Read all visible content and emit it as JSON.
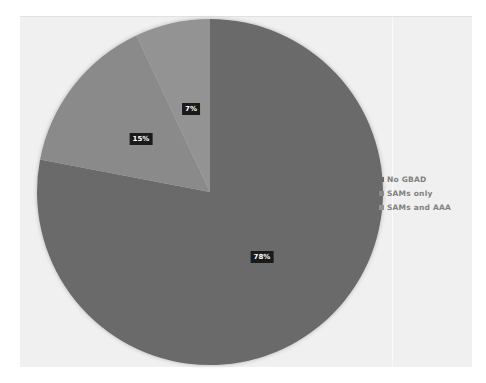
{
  "chart_data": {
    "type": "pie",
    "title": "",
    "categories": [
      "No GBAD",
      "SAMs only",
      "SAMs and AAA"
    ],
    "values": [
      78,
      15,
      7
    ],
    "labels": [
      "78%",
      "15%",
      "7%"
    ],
    "colors": [
      "#6b6b6b",
      "#8a8a8a",
      "#939393"
    ],
    "start_angle_deg": 0,
    "direction": "clockwise",
    "legend_position": "right"
  },
  "legend": {
    "items": [
      {
        "label": "No GBAD",
        "color": "#6b6b6b"
      },
      {
        "label": "SAMs only",
        "color": "#8a8a8a"
      },
      {
        "label": "SAMs and AAA",
        "color": "#939393"
      }
    ]
  },
  "data_labels": {
    "no_gbad": "78%",
    "sams_only": "15%",
    "sams_and_aaa": "7%"
  }
}
